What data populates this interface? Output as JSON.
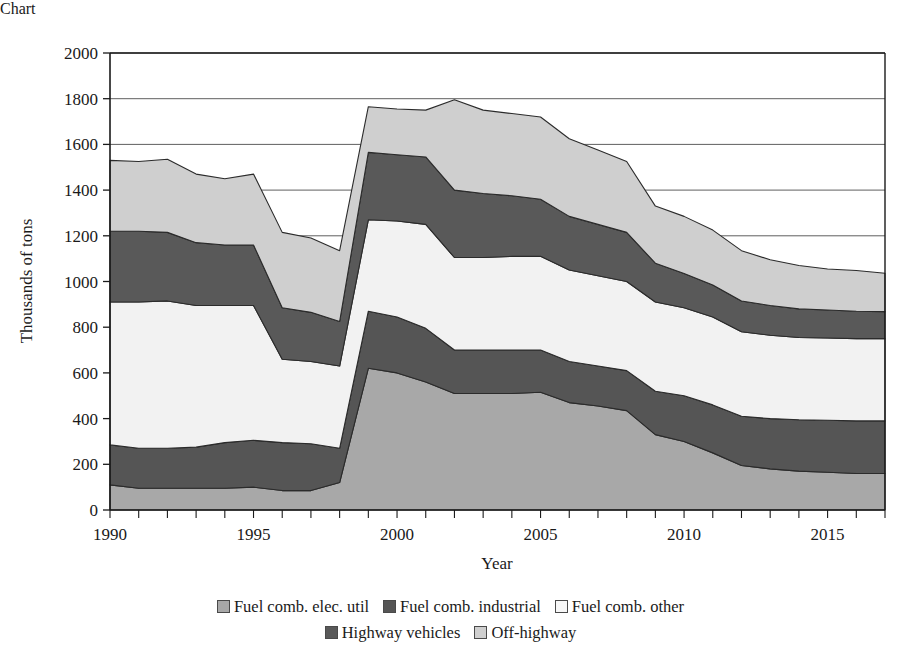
{
  "chart_data": {
    "type": "area",
    "stacked": true,
    "title": "",
    "xlabel": "Year",
    "ylabel": "Thousands of tons",
    "xlim": [
      1990,
      2017
    ],
    "ylim": [
      0,
      2000
    ],
    "ytick_step": 200,
    "yticks": [
      0,
      200,
      400,
      600,
      800,
      1000,
      1200,
      1400,
      1600,
      1800,
      2000
    ],
    "xticks_labeled": [
      1990,
      1995,
      2000,
      2005,
      2010,
      2015
    ],
    "xtick_step_minor": 1,
    "grid": "horizontal",
    "legend_position": "bottom",
    "x": [
      1990,
      1991,
      1992,
      1993,
      1994,
      1995,
      1996,
      1997,
      1998,
      1999,
      2000,
      2001,
      2002,
      2003,
      2004,
      2005,
      2006,
      2007,
      2008,
      2009,
      2010,
      2011,
      2012,
      2013,
      2014,
      2015,
      2016,
      2017
    ],
    "series": [
      {
        "name": "Fuel comb. elec. util",
        "color": "#a8a8a8",
        "values": [
          110,
          95,
          95,
          95,
          95,
          100,
          85,
          85,
          120,
          620,
          600,
          560,
          510,
          510,
          510,
          515,
          470,
          455,
          435,
          330,
          300,
          250,
          195,
          180,
          170,
          165,
          160,
          160
        ]
      },
      {
        "name": "Fuel comb. industrial",
        "color": "#555555",
        "values": [
          175,
          175,
          175,
          180,
          200,
          205,
          210,
          205,
          150,
          250,
          245,
          235,
          190,
          190,
          190,
          185,
          180,
          175,
          175,
          190,
          200,
          210,
          215,
          220,
          225,
          228,
          230,
          230
        ]
      },
      {
        "name": "Fuel comb. other",
        "color": "#f2f2f2",
        "values": [
          625,
          640,
          645,
          620,
          600,
          590,
          365,
          360,
          360,
          400,
          420,
          455,
          405,
          405,
          410,
          410,
          400,
          395,
          390,
          390,
          385,
          385,
          370,
          365,
          360,
          360,
          360,
          360
        ]
      },
      {
        "name": "Highway vehicles",
        "color": "#595959",
        "values": [
          310,
          310,
          300,
          275,
          265,
          265,
          225,
          215,
          195,
          295,
          290,
          295,
          295,
          280,
          265,
          250,
          235,
          225,
          215,
          170,
          150,
          140,
          135,
          130,
          125,
          122,
          120,
          118
        ]
      },
      {
        "name": "Off-highway",
        "color": "#cfcfcf",
        "values": [
          310,
          305,
          320,
          300,
          290,
          310,
          330,
          325,
          310,
          200,
          200,
          205,
          395,
          365,
          360,
          360,
          340,
          325,
          310,
          250,
          250,
          240,
          220,
          200,
          190,
          180,
          178,
          168
        ]
      }
    ],
    "totals": [
      1530,
      1525,
      1535,
      1470,
      1450,
      1470,
      1215,
      1190,
      1135,
      1765,
      1755,
      1750,
      1795,
      1750,
      1735,
      1720,
      1625,
      1575,
      1525,
      1330,
      1285,
      1225,
      1135,
      1095,
      1070,
      1055,
      1048,
      1036
    ]
  },
  "axes": {
    "ylabel": "Thousands of tons",
    "xlabel": "Year",
    "ytick_labels": [
      "0",
      "200",
      "400",
      "600",
      "800",
      "1000",
      "1200",
      "1400",
      "1600",
      "1800",
      "2000"
    ],
    "xtick_labels": [
      "1990",
      "1995",
      "2000",
      "2005",
      "2010",
      "2015"
    ]
  },
  "legend": {
    "row1": [
      {
        "label": "Fuel comb. elec. util",
        "color": "#a8a8a8"
      },
      {
        "label": "Fuel comb. industrial",
        "color": "#555555"
      },
      {
        "label": "Fuel comb. other",
        "color": "#f7f7f7"
      }
    ],
    "row2": [
      {
        "label": "Highway vehicles",
        "color": "#595959"
      },
      {
        "label": "Off-highway",
        "color": "#cfcfcf"
      }
    ]
  },
  "style": {
    "plot_bg": "#ffffff",
    "axis_color": "#1a1a1a",
    "grid_color": "#4d4d4d",
    "outline_color": "#2b2b2b"
  }
}
